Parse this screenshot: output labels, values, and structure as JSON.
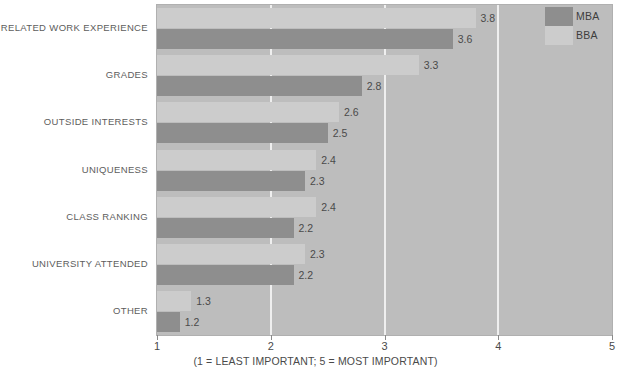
{
  "chart_data": {
    "type": "bar",
    "orientation": "horizontal",
    "title": "",
    "subtitle": "",
    "xlabel": "(1 = LEAST IMPORTANT; 5 = MOST IMPORTANT)",
    "ylabel": "",
    "xlim": [
      1,
      5
    ],
    "xticks": [
      "1",
      "2",
      "3",
      "4",
      "5"
    ],
    "grid": true,
    "legend_position": "top-right",
    "categories": [
      "RELATED WORK EXPERIENCE",
      "GRADES",
      "OUTSIDE INTERESTS",
      "UNIQUENESS",
      "CLASS RANKING",
      "UNIVERSITY ATTENDED",
      "OTHER"
    ],
    "series": [
      {
        "name": "MBA",
        "color": "#8e8e8e",
        "values": [
          3.6,
          2.8,
          2.5,
          2.3,
          2.2,
          2.2,
          1.2
        ]
      },
      {
        "name": "BBA",
        "color": "#cccccc",
        "values": [
          3.8,
          3.3,
          2.6,
          2.4,
          2.4,
          2.3,
          1.3
        ]
      }
    ],
    "value_labels": {
      "RELATED WORK EXPERIENCE": {
        "BBA": "3.8",
        "MBA": "3.6"
      },
      "GRADES": {
        "BBA": "3.3",
        "MBA": "2.8"
      },
      "OUTSIDE INTERESTS": {
        "BBA": "2.6",
        "MBA": "2.5"
      },
      "UNIQUENESS": {
        "BBA": "2.4",
        "MBA": "2.3"
      },
      "CLASS RANKING": {
        "BBA": "2.4",
        "MBA": "2.2"
      },
      "UNIVERSITY ATTENDED": {
        "BBA": "2.3",
        "MBA": "2.2"
      },
      "OTHER": {
        "BBA": "1.3",
        "MBA": "1.2"
      }
    },
    "colors": {
      "plot_background": "#bdbdbd",
      "gridline": "#efefef",
      "mba_bar": "#8e8e8e",
      "bba_bar": "#cccccc",
      "text": "#4a4a4a"
    }
  },
  "legend": {
    "items": [
      {
        "label": "MBA",
        "color": "#8e8e8e"
      },
      {
        "label": "BBA",
        "color": "#cccccc"
      }
    ]
  },
  "axis": {
    "ticks": [
      "1",
      "2",
      "3",
      "4",
      "5"
    ],
    "caption": "(1 = LEAST IMPORTANT; 5 = MOST IMPORTANT)"
  }
}
